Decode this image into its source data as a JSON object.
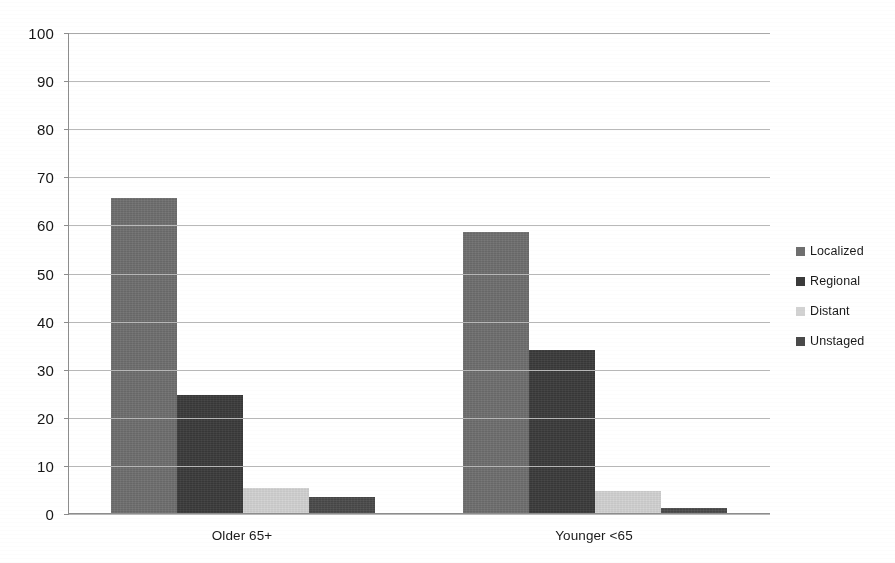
{
  "chart_data": {
    "type": "bar",
    "title": "",
    "subtitle": "",
    "xlabel": "",
    "ylabel": "",
    "categories": [
      "Older 65+",
      "Younger <65"
    ],
    "series": [
      {
        "name": "Localized",
        "values": [
          65.5,
          58.4
        ],
        "color": "#6e6e6e"
      },
      {
        "name": "Regional",
        "values": [
          24.5,
          33.9
        ],
        "color": "#3a3a3a"
      },
      {
        "name": "Distant",
        "values": [
          5.2,
          4.6
        ],
        "color": "#d2d2d2"
      },
      {
        "name": "Unstaged",
        "values": [
          3.3,
          1.1
        ],
        "color": "#4a4a4a"
      }
    ],
    "ylim": [
      0,
      100
    ],
    "ytick_step": 10,
    "ytick_labels": [
      "0",
      "10",
      "20",
      "30",
      "40",
      "50",
      "60",
      "70",
      "80",
      "90",
      "100"
    ],
    "grid": true,
    "grid_axis": "y",
    "legend_position": "right",
    "bar_group_layout": "clustered",
    "background_color": "#ffffff",
    "gridline_color": "#b9b9b9",
    "axis_color": "#8d8d8d",
    "text_color": "#1a1a1a"
  },
  "legend": {
    "items": [
      {
        "label": "Localized",
        "color": "#6e6e6e"
      },
      {
        "label": "Regional",
        "color": "#3a3a3a"
      },
      {
        "label": "Distant",
        "color": "#d2d2d2"
      },
      {
        "label": "Unstaged",
        "color": "#4a4a4a"
      }
    ]
  },
  "axes": {
    "y_ticks": [
      "100",
      "90",
      "80",
      "70",
      "60",
      "50",
      "40",
      "30",
      "20",
      "10",
      "0"
    ],
    "x_categories": [
      "Older 65+",
      "Younger <65"
    ]
  }
}
